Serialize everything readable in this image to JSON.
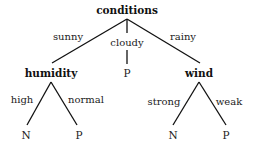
{
  "tree": {
    "root": "conditions",
    "branches": [
      {
        "edge": "sunny",
        "node": "humidity",
        "children": [
          {
            "edge": "high",
            "leaf": "N"
          },
          {
            "edge": "normal",
            "leaf": "P"
          }
        ]
      },
      {
        "edge": "cloudy",
        "leaf": "P"
      },
      {
        "edge": "rainy",
        "node": "wind",
        "children": [
          {
            "edge": "strong",
            "leaf": "N"
          },
          {
            "edge": "weak",
            "leaf": "P"
          }
        ]
      }
    ]
  }
}
